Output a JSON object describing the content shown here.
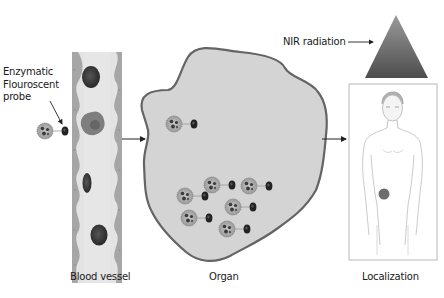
{
  "probe_label": {
    "line1": "Enzymatic",
    "line2": "Flouroscent",
    "line3": "probe"
  },
  "stages": [
    {
      "id": "blood-vessel",
      "label": "Blood vessel"
    },
    {
      "id": "organ",
      "label": "Organ"
    },
    {
      "id": "localization",
      "label": "Localization"
    }
  ],
  "radiation": {
    "label": "NIR radiation"
  },
  "colors": {
    "organ_fill": "#d4d4d4",
    "organ_stroke": "#666666",
    "vessel_wall": "#9a9a9a",
    "vessel_lumen": "#e0e0e0",
    "cell_dark": "#333333",
    "cell_medium": "#7a7a7a",
    "triangle_top": "#8a8a8a",
    "triangle_bottom": "#4a4a4a"
  },
  "probe_count_in_organ": 7
}
